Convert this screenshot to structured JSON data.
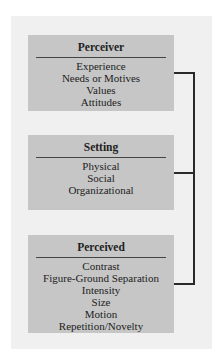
{
  "boxes": [
    {
      "title": "Perceiver",
      "items": [
        "Experience",
        "Needs or Motives",
        "Values",
        "Attitudes"
      ]
    },
    {
      "title": "Setting",
      "items": [
        "Physical",
        "Social",
        "Organizational"
      ]
    },
    {
      "title": "Perceived",
      "items": [
        "Contrast",
        "Figure-Ground Separation",
        "Intensity",
        "Size",
        "Motion",
        "Repetition/Novelty"
      ]
    }
  ],
  "colors": {
    "panel": "#f0f0f0",
    "box": "#c6c6c6",
    "line": "#2a2a2a",
    "text": "#222222"
  }
}
